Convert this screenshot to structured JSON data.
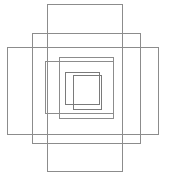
{
  "figure": {
    "type": "rectangle-outline-diagram",
    "background_color": "#ffffff",
    "canvas": {
      "width": 173,
      "height": 183
    },
    "shape_count": 7,
    "shapes": [
      {
        "name": "rectangle-tall-vertical",
        "label": "1",
        "x": 47,
        "y": 4,
        "width": 75,
        "height": 167,
        "stroke": "#8c8c8c",
        "stroke_width": 1
      },
      {
        "name": "rectangle-outer-medium",
        "label": "2",
        "x": 32,
        "y": 33,
        "width": 108,
        "height": 110,
        "stroke": "#8c8c8c",
        "stroke_width": 1
      },
      {
        "name": "rectangle-wide-horizontal",
        "label": "3",
        "x": 7,
        "y": 47,
        "width": 151,
        "height": 87,
        "stroke": "#8c8c8c",
        "stroke_width": 1
      },
      {
        "name": "rectangle-mid-large",
        "label": "4",
        "x": 45,
        "y": 61,
        "width": 68,
        "height": 52,
        "stroke": "#8c8c8c",
        "stroke_width": 1
      },
      {
        "name": "rectangle-mid-small",
        "label": "5",
        "x": 59,
        "y": 57,
        "width": 54,
        "height": 61,
        "stroke": "#8c8c8c",
        "stroke_width": 1.6
      },
      {
        "name": "rectangle-inner-left",
        "label": "6",
        "x": 65,
        "y": 72,
        "width": 34,
        "height": 32,
        "stroke": "#7a7a7a",
        "stroke_width": 1
      },
      {
        "name": "rectangle-innermost",
        "label": "7",
        "x": 73,
        "y": 75,
        "width": 28,
        "height": 34,
        "stroke": "#7a7a7a",
        "stroke_width": 1.6
      }
    ]
  }
}
